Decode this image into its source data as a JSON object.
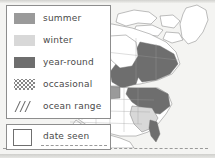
{
  "legend": {
    "items": [
      {
        "label": "summer",
        "swatch": "solid-fill-swatch",
        "color": "#9a9a9a"
      },
      {
        "label": "winter",
        "swatch": "solid-fill-swatch",
        "color": "#d8d8d8"
      },
      {
        "label": "year-round",
        "swatch": "solid-fill-swatch",
        "color": "#6e6e6e"
      },
      {
        "label": "occasional",
        "swatch": "dotted-pattern-swatch",
        "color": "#7d7d7d"
      },
      {
        "label": "ocean range",
        "swatch": "diagonal-hatch-swatch",
        "color": "#6b6b6b"
      }
    ]
  },
  "date_seen": {
    "label": "date seen",
    "value": "",
    "placeholder": ""
  },
  "map": {
    "name": "north-america-range-map",
    "regions": [
      "Alaska",
      "Canada",
      "United States",
      "Mexico",
      "Greenland"
    ],
    "fills": {
      "summer": "#9a9a9a",
      "winter": "#d8d8d8",
      "year_round": "#6e6e6e",
      "land": "#ffffff",
      "outline": "#6f6f6f"
    }
  },
  "colors": {
    "panel_background": "#ffffff",
    "panel_border": "#8d8d8d",
    "page_background": "#f4f4f2",
    "text": "#4a4a4a",
    "dashed_rule": "#9a9a9a"
  }
}
